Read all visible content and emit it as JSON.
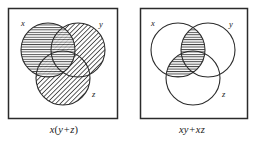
{
  "figure": {
    "type": "venn-diagram-pair",
    "panels": [
      {
        "id": "left",
        "caption": "x(y+z)",
        "caption_parts": {
          "lhs": "x",
          "open": "(",
          "first": "y",
          "op": "+",
          "second": "z",
          "close": ")"
        },
        "box": {
          "x": 8,
          "y": 8,
          "width": 110,
          "height": 111
        },
        "circles": [
          {
            "label": "x",
            "cx": 48,
            "cy": 50,
            "r": 27,
            "fill": "horizontal-hatch",
            "label_x": 21,
            "label_y": 24
          },
          {
            "label": "y",
            "cx": 78,
            "cy": 50,
            "r": 27,
            "fill": "diagonal-hatch",
            "label_x": 101,
            "label_y": 25
          },
          {
            "label": "z",
            "cx": 63,
            "cy": 78,
            "r": 27,
            "fill": "diagonal-hatch",
            "label_x": 93,
            "label_y": 95
          }
        ],
        "shaded_regions": [
          "x",
          "y",
          "z"
        ],
        "hatch_notes": "circle x horizontal lines, circles y and z diagonal lines, overlaps cross-hatched"
      },
      {
        "id": "right",
        "caption": "xy + xz",
        "caption_parts": {
          "lhs": "x",
          "open": "",
          "first": "y",
          "op": "+",
          "second": "xz",
          "close": ""
        },
        "box": {
          "x": 140,
          "y": 8,
          "width": 108,
          "height": 111
        },
        "circles": [
          {
            "label": "x",
            "cx": 178,
            "cy": 50,
            "r": 27,
            "fill": "none",
            "label_x": 151,
            "label_y": 24
          },
          {
            "label": "y",
            "cx": 208,
            "cy": 50,
            "r": 27,
            "fill": "none",
            "label_x": 231,
            "label_y": 25
          },
          {
            "label": "z",
            "cx": 193,
            "cy": 78,
            "r": 27,
            "fill": "none",
            "label_x": 223,
            "label_y": 95
          }
        ],
        "shaded_regions": [
          "x-intersect-y",
          "x-intersect-z"
        ],
        "hatch_notes": "only the two lens-shaped intersections x∩y and x∩z are filled with horizontal lines"
      }
    ],
    "colors": {
      "ink": "#1a1a1a",
      "stroke": "#2b2b2b",
      "hatch": "#3a3a3a",
      "background": "#ffffff"
    }
  }
}
